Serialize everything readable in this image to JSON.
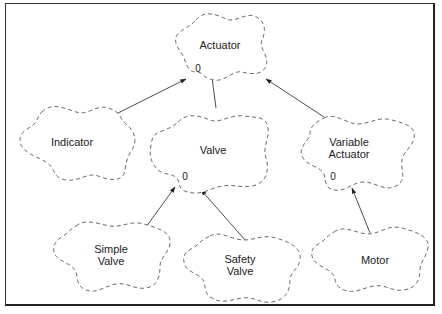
{
  "diagram": {
    "type": "class-hierarchy (Booch cloud notation)",
    "nodes": [
      {
        "id": "actuator",
        "label_lines": [
          "Actuator"
        ],
        "multiplicity": "0"
      },
      {
        "id": "indicator",
        "label_lines": [
          "Indicator"
        ],
        "multiplicity": ""
      },
      {
        "id": "valve",
        "label_lines": [
          "Valve"
        ],
        "multiplicity": "0"
      },
      {
        "id": "variable_actuator",
        "label_lines": [
          "Variable",
          "Actuator"
        ],
        "multiplicity": "0"
      },
      {
        "id": "simple_valve",
        "label_lines": [
          "Simple",
          "Valve"
        ],
        "multiplicity": ""
      },
      {
        "id": "safety_valve",
        "label_lines": [
          "Safety",
          "Valve"
        ],
        "multiplicity": ""
      },
      {
        "id": "motor",
        "label_lines": [
          "Motor"
        ],
        "multiplicity": ""
      }
    ],
    "edges": [
      {
        "from": "indicator",
        "to": "actuator",
        "kind": "inherits"
      },
      {
        "from": "valve",
        "to": "actuator",
        "kind": "inherits"
      },
      {
        "from": "variable_actuator",
        "to": "actuator",
        "kind": "inherits"
      },
      {
        "from": "simple_valve",
        "to": "valve",
        "kind": "inherits"
      },
      {
        "from": "safety_valve",
        "to": "valve",
        "kind": "inherits"
      },
      {
        "from": "motor",
        "to": "variable_actuator",
        "kind": "inherits"
      }
    ]
  },
  "colors": {
    "cloud_stroke": "#6a6a6a",
    "edge": "#3a3a3a",
    "frame": "#333333",
    "text": "#222222"
  }
}
